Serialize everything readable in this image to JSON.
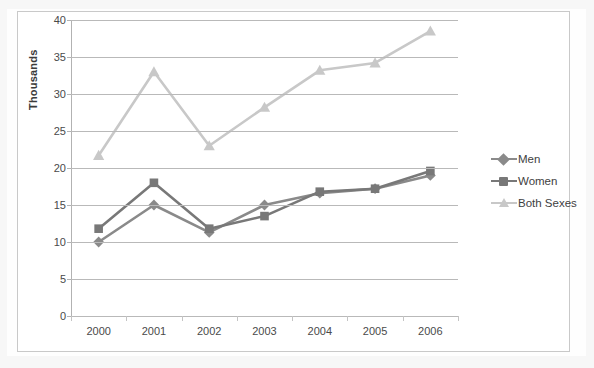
{
  "chart_data": {
    "type": "line",
    "title": "",
    "subtitle": "",
    "xlabel": "",
    "ylabel": "Thousands",
    "categories": [
      "2000",
      "2001",
      "2002",
      "2003",
      "2004",
      "2005",
      "2006"
    ],
    "x": [
      2000,
      2001,
      2002,
      2003,
      2004,
      2005,
      2006
    ],
    "ylim": [
      0,
      40
    ],
    "ytick_interval": 5,
    "ytick_labels": [
      "0",
      "5",
      "10",
      "15",
      "20",
      "25",
      "30",
      "35",
      "40"
    ],
    "ytick_values": [
      0,
      5,
      10,
      15,
      20,
      25,
      30,
      35,
      40
    ],
    "grid": "horizontal",
    "legend_position": "right",
    "series": [
      {
        "name": "Men",
        "marker": "diamond",
        "color": "#8a8a8a",
        "values": [
          10.0,
          15.0,
          11.3,
          15.0,
          16.6,
          17.2,
          19.0
        ]
      },
      {
        "name": "Women",
        "marker": "square",
        "color": "#787878",
        "values": [
          11.8,
          18.0,
          11.8,
          13.5,
          16.8,
          17.2,
          19.6
        ]
      },
      {
        "name": "Both Sexes",
        "marker": "triangle",
        "color": "#c8c8c8",
        "values": [
          21.7,
          33.0,
          23.0,
          28.2,
          33.2,
          34.2,
          38.5
        ]
      }
    ]
  },
  "axes": {
    "y_title": "Thousands",
    "y_labels": [
      "40",
      "35",
      "30",
      "25",
      "20",
      "15",
      "10",
      "5",
      "0"
    ],
    "x_labels": [
      "2000",
      "2001",
      "2002",
      "2003",
      "2004",
      "2005",
      "2006"
    ]
  },
  "legend": {
    "items": [
      {
        "label": "Men",
        "marker_name": "diamond-marker-icon",
        "color": "#8a8a8a"
      },
      {
        "label": "Women",
        "marker_name": "square-marker-icon",
        "color": "#787878"
      },
      {
        "label": "Both Sexes",
        "marker_name": "triangle-marker-icon",
        "color": "#c8c8c8"
      }
    ]
  },
  "colors": {
    "men": "#8a8a8a",
    "women": "#787878",
    "both_sexes": "#c8c8c8",
    "gridline": "#b9b9b9",
    "frame": "#c9c9c9",
    "text": "#4a4a4a",
    "background": "#ffffff"
  }
}
